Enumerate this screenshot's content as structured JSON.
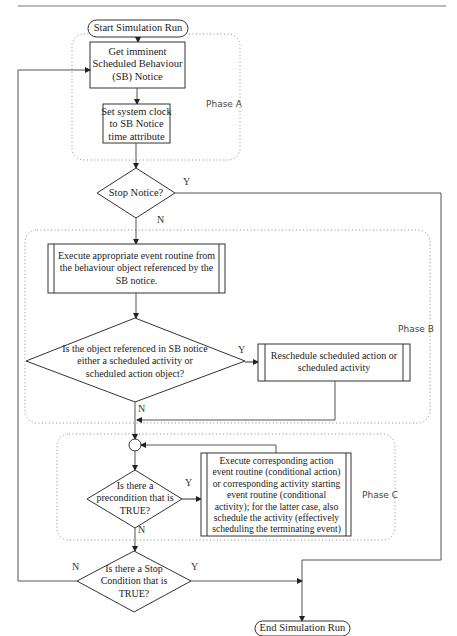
{
  "header_rule": true,
  "nodes": {
    "start": "Start Simulation Run",
    "get_notice": [
      "Get imminent",
      "Scheduled Behaviour",
      "(SB) Notice"
    ],
    "set_clock": [
      "Set system clock",
      "to SB Notice",
      "time attribute"
    ],
    "stop_notice": "Stop Notice?",
    "execute_event": [
      "Execute appropriate event routine from",
      "the behaviour object referenced by the",
      "SB notice."
    ],
    "is_scheduled": [
      "Is the object referenced in SB notice",
      "either a scheduled activity or",
      "scheduled action object?"
    ],
    "reschedule": [
      "Reschedule scheduled action or",
      "scheduled activity"
    ],
    "precondition": [
      "Is there a",
      "precondition that is",
      "TRUE?"
    ],
    "execute_conditional": [
      "Execute corresponding action",
      "event routine (conditional action)",
      "or corresponding activity starting",
      "event routine (conditional",
      "activity); for the latter case, also",
      "schedule the activity (effectively",
      "scheduling the terminating event)"
    ],
    "stop_condition": [
      "Is there a Stop",
      "Condition that is",
      "TRUE?"
    ],
    "end": "End Simulation Run"
  },
  "edge_labels": {
    "stop_notice_yes": "Y",
    "stop_notice_no": "N",
    "is_scheduled_yes": "Y",
    "is_scheduled_no": "N",
    "precondition_yes": "Y",
    "precondition_no": "N",
    "stop_condition_no": "N",
    "stop_condition_yes": "Y"
  },
  "phases": {
    "a": "Phase A",
    "b": "Phase B",
    "c": "Phase C"
  },
  "colors": {
    "line": "#555555",
    "box_border": "#333333",
    "phase_border": "#888888"
  }
}
